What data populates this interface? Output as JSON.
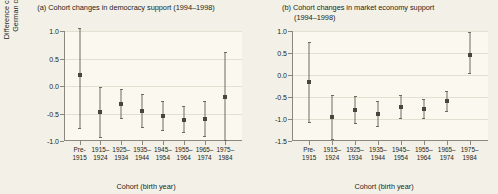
{
  "figure": {
    "background": "#f3f1e7",
    "plot_background": "#faf8ef",
    "marker_color": "#4a463c",
    "line_color": "#6f6a5d",
    "grid_color": "#e3e0d2",
    "axis_color": "#8c877a"
  },
  "chart_data": [
    {
      "type": "scatter",
      "panel": "a",
      "title": "(a) Cohort changes in democracy support (1994–1998)",
      "xlabel": "Cohort (birth year)",
      "ylabel": "Difference change in East-West German cohorts (1994–98)",
      "ylabel_line1": "Difference change in East-West",
      "ylabel_line2": "German cohorts (1994–98)",
      "grid": true,
      "legend": "none",
      "ylim": [
        -1.0,
        1.0
      ],
      "yticks": [
        1.0,
        0.5,
        0.0,
        -0.5,
        -1.0
      ],
      "ytick_labels": [
        "1.0",
        "0.5",
        "0.0",
        "-0.5",
        "-1.0"
      ],
      "categories": [
        "Pre-1915",
        "1915–1924",
        "1925–1934",
        "1935–1944",
        "1945–1954",
        "1955–1964",
        "1965–1974",
        "1975–1984"
      ],
      "category_lines": [
        [
          "Pre-",
          "1915"
        ],
        [
          "1915–",
          "1924"
        ],
        [
          "1925–",
          "1934"
        ],
        [
          "1935–",
          "1944"
        ],
        [
          "1945–",
          "1954"
        ],
        [
          "1955–",
          "1964"
        ],
        [
          "1965–",
          "1974"
        ],
        [
          "1975–",
          "1984"
        ]
      ],
      "values": [
        0.2,
        -0.47,
        -0.32,
        -0.45,
        -0.55,
        -0.62,
        -0.6,
        -0.2
      ],
      "ci_low": [
        -0.78,
        -0.95,
        -0.6,
        -0.76,
        -0.82,
        -0.86,
        -0.93,
        -1.0
      ],
      "ci_high": [
        1.05,
        -0.02,
        -0.05,
        -0.14,
        -0.28,
        -0.37,
        -0.28,
        0.62
      ]
    },
    {
      "type": "scatter",
      "panel": "b",
      "title": "(b) Cohort changes in market economy support (1994–1998)",
      "title_line1": "(b) Cohort changes in market economy support",
      "title_line2": "(1994–1998)",
      "xlabel": "Cohort (birth year)",
      "ylabel": "",
      "grid": true,
      "legend": "none",
      "ylim": [
        -1.5,
        1.0
      ],
      "yticks": [
        1.0,
        0.5,
        0.0,
        -0.5,
        -1.0,
        -1.5
      ],
      "ytick_labels": [
        "1.0",
        "0.5",
        "0.0",
        "-0.5",
        "-1.0",
        "-1.5"
      ],
      "categories": [
        "Pre-1915",
        "1915–1924",
        "1925–1934",
        "1935–1944",
        "1945–1954",
        "1955–1964",
        "1965–1974",
        "1975–1984"
      ],
      "category_lines": [
        [
          "Pre-",
          "1915"
        ],
        [
          "1915–",
          "1924"
        ],
        [
          "1925–",
          "1934"
        ],
        [
          "1935–",
          "1944"
        ],
        [
          "1945–",
          "1954"
        ],
        [
          "1955–",
          "1964"
        ],
        [
          "1965–",
          "1974"
        ],
        [
          "1975–",
          "1984"
        ]
      ],
      "values": [
        -0.17,
        -0.96,
        -0.8,
        -0.88,
        -0.72,
        -0.78,
        -0.6,
        -0.52,
        0.45
      ],
      "values_final": [
        -0.17,
        -0.96,
        -0.8,
        -0.88,
        -0.72,
        -0.78,
        -0.6,
        0.45
      ],
      "ci_low": [
        -1.1,
        -1.47,
        -1.12,
        -1.18,
        -1.0,
        -1.0,
        -0.83,
        0.02
      ],
      "ci_high": [
        0.76,
        -0.45,
        -0.48,
        -0.58,
        -0.45,
        -0.55,
        -0.37,
        0.98
      ]
    }
  ]
}
